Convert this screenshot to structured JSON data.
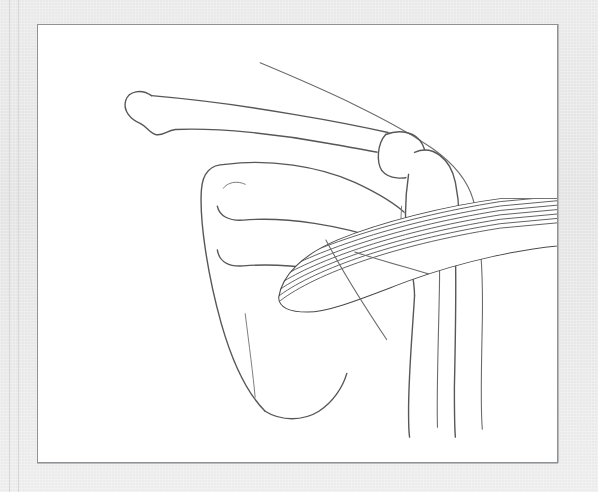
{
  "figure": {
    "medium": "anatomical line drawing",
    "frame": {
      "mat_color": "#e6e6e6",
      "plate_color": "#ffffff",
      "inner_border_color": "#8f9193",
      "plate_rect": {
        "x": 37,
        "y": 24,
        "width": 521,
        "height": 439
      }
    },
    "palette": {
      "line": "#575757",
      "line_thin": "#6b6b6b",
      "line_fine": "#7d7d7d",
      "muscle_outline": "#4a4a4a",
      "muscle_striation": "#3d3d3d",
      "background": "#ffffff"
    },
    "structures": [
      {
        "id": "clavicle",
        "label": "Clavicle",
        "shaded": false
      },
      {
        "id": "scapula",
        "label": "Scapula",
        "shaded": false
      },
      {
        "id": "scapular-spine",
        "label": "Spine of scapula",
        "shaded": false
      },
      {
        "id": "acromion",
        "label": "Acromion",
        "shaded": false
      },
      {
        "id": "coracoid-process",
        "label": "Coracoid process",
        "shaded": false
      },
      {
        "id": "humerus-head",
        "label": "Head of humerus",
        "shaded": false
      },
      {
        "id": "humerus-shaft",
        "label": "Shaft of humerus",
        "shaded": false
      },
      {
        "id": "joint-capsule",
        "label": "Joint capsule fibers",
        "shaded": false
      },
      {
        "id": "teres-major",
        "label": "Teres major muscle",
        "shaded": true,
        "striation_count": 34
      },
      {
        "id": "body-contour",
        "label": "Body / arm skin contour",
        "shaded": false
      }
    ],
    "caption": ""
  }
}
